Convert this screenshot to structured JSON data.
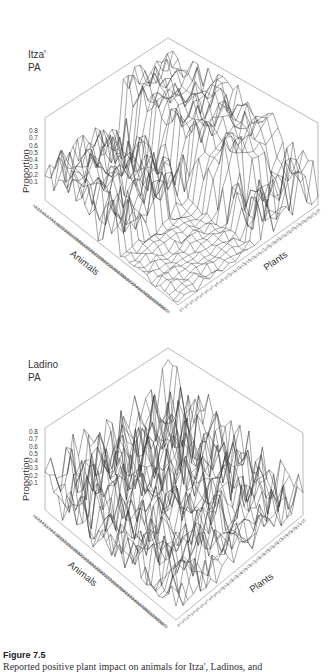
{
  "figure": {
    "title": "Figure 7.5",
    "caption": "Reported positive plant impact on animals for Itza', Ladinos, and"
  },
  "chart_data": [
    {
      "type": "surface3d",
      "panel_label_line1": "Itza'",
      "panel_label_line2": "PA",
      "zlabel": "Proportion",
      "xlabel": "Animals",
      "ylabel": "Plants",
      "zticks": [
        "0.8",
        "0.7",
        "0.6",
        "0.5",
        "0.4",
        "0.3",
        "0.2",
        "0.1"
      ],
      "zlim": [
        0,
        0.8
      ],
      "animal_count": 58,
      "plant_count": 28,
      "x_tick_prefix": "A",
      "y_tick_prefix": "P",
      "seed": 7,
      "profile": "itza",
      "notes": "Wireframe surface; high ridge (~0.8) across animals for plants near the top-right; low flat region for mid animals / low-index plants"
    },
    {
      "type": "surface3d",
      "panel_label_line1": "Ladino",
      "panel_label_line2": "PA",
      "zlabel": "Proportion",
      "xlabel": "Animals",
      "ylabel": "Plants",
      "zticks": [
        "0.8",
        "0.7",
        "0.6",
        "0.5",
        "0.4",
        "0.3",
        "0.2",
        "0.1"
      ],
      "zlim": [
        0,
        0.8
      ],
      "animal_count": 58,
      "plant_count": 28,
      "x_tick_prefix": "A",
      "y_tick_prefix": "P",
      "seed": 19,
      "profile": "ladino",
      "notes": "Wireframe surface; broadly spiky across the whole grid with peaks up to ~0.8 near the back corner"
    }
  ],
  "colors": {
    "line": "#3a3a3a",
    "frame": "#8a8a8a",
    "background": "#ffffff"
  }
}
